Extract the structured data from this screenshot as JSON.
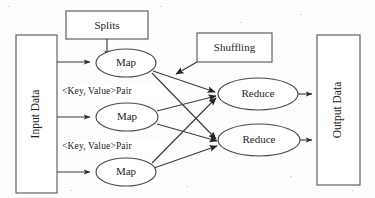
{
  "diagram": {
    "background_color": "#fdfdfd",
    "line_color": "#3c3c3c",
    "text_color": "#1d1d1d",
    "nodes": {
      "input_data": {
        "label": "Input Data",
        "shape": "rectangle",
        "orientation": "vertical-text",
        "x": 16,
        "y": 35,
        "w": 41,
        "h": 158
      },
      "splits": {
        "label": "Splits",
        "shape": "rectangle",
        "x": 66,
        "y": 11,
        "w": 82,
        "h": 28
      },
      "shuffling": {
        "label": "Shuffling",
        "shape": "rectangle",
        "x": 197,
        "y": 33,
        "w": 75,
        "h": 29
      },
      "output_data": {
        "label": "Output Data",
        "shape": "rectangle",
        "orientation": "vertical-text",
        "x": 317,
        "y": 35,
        "w": 43,
        "h": 150
      },
      "map_1": {
        "label": "Map",
        "shape": "ellipse",
        "cx": 126,
        "cy": 63,
        "rx": 30,
        "ry": 14
      },
      "map_2": {
        "label": "Map",
        "shape": "ellipse",
        "cx": 127,
        "cy": 117,
        "rx": 31,
        "ry": 14
      },
      "map_3": {
        "label": "Map",
        "shape": "ellipse",
        "cx": 126,
        "cy": 172,
        "rx": 30,
        "ry": 14
      },
      "reduce_1": {
        "label": "Reduce",
        "shape": "ellipse",
        "cx": 258,
        "cy": 94,
        "rx": 40,
        "ry": 16
      },
      "reduce_2": {
        "label": "Reduce",
        "shape": "ellipse",
        "cx": 259,
        "cy": 140,
        "rx": 41,
        "ry": 16
      }
    },
    "edge_labels": {
      "pair_1": {
        "text": "<Key, Value>Pair",
        "x": 62,
        "y": 92
      },
      "pair_2": {
        "text": "<Key, Value>Pair",
        "x": 62,
        "y": 147
      }
    },
    "edges": [
      {
        "from": "splits",
        "to": "map_1",
        "kind": "arrow"
      },
      {
        "from": "input_data",
        "to": "map_1",
        "kind": "arrow"
      },
      {
        "from": "input_data",
        "to": "map_2",
        "kind": "arrow"
      },
      {
        "from": "input_data",
        "to": "map_3",
        "kind": "arrow"
      },
      {
        "from": "map_1",
        "to": "reduce_1",
        "kind": "arrow"
      },
      {
        "from": "map_1",
        "to": "reduce_2",
        "kind": "arrow"
      },
      {
        "from": "map_2",
        "to": "reduce_1",
        "kind": "arrow"
      },
      {
        "from": "map_2",
        "to": "reduce_2",
        "kind": "arrow"
      },
      {
        "from": "map_3",
        "to": "reduce_1",
        "kind": "arrow"
      },
      {
        "from": "map_3",
        "to": "reduce_2",
        "kind": "arrow"
      },
      {
        "from": "shuffling",
        "to": "map_to_reduce_region",
        "kind": "arrow"
      },
      {
        "from": "reduce_1",
        "to": "output_data",
        "kind": "arrow"
      },
      {
        "from": "reduce_2",
        "to": "output_data",
        "kind": "arrow"
      }
    ]
  }
}
